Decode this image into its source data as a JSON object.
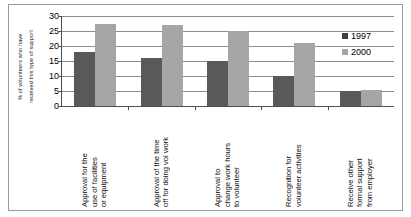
{
  "chart_data": {
    "type": "bar",
    "title": "",
    "subtitle": "",
    "xlabel": "",
    "ylabel": "% of volunteers who have received this type of support",
    "ylabel_lines": [
      "% of volunteers who have",
      "received  this type of support"
    ],
    "ylim": [
      0,
      30
    ],
    "yticks": [
      30,
      25,
      20,
      15,
      10,
      5,
      0
    ],
    "grid": true,
    "legend_position": "top-right",
    "categories": [
      "Approval for the use of facilities or equipment",
      "Approval of the time off for doing vol work",
      "Approval to change work hours to volunteer",
      "Recognition for volunteer activities",
      "Receive other formal support from employer"
    ],
    "category_lines": [
      [
        "Approval for the",
        "use of facilities",
        "or equipment"
      ],
      [
        "Approval of the time",
        "off for doing vol work"
      ],
      [
        "Approval to",
        "change work hours",
        "to volunteer"
      ],
      [
        "Recognition for",
        "volunteer activities"
      ],
      [
        "Receive other",
        "formal support",
        "from employer"
      ]
    ],
    "series": [
      {
        "name": "1997",
        "color": "#595959",
        "values": [
          18,
          16,
          15,
          10,
          5
        ]
      },
      {
        "name": "2000",
        "color": "#a6a6a6",
        "values": [
          27.5,
          27,
          25,
          21,
          5.5
        ]
      }
    ]
  },
  "legend": {
    "entries": [
      {
        "label": "1997"
      },
      {
        "label": "2000"
      }
    ]
  },
  "caption": {
    "text": ""
  }
}
